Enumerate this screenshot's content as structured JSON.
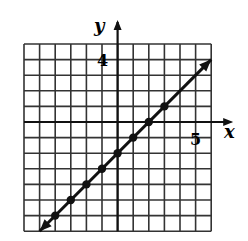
{
  "chart_data": {
    "type": "line",
    "title": "",
    "xlabel": "x",
    "ylabel": "y",
    "xlim": [
      -6,
      6
    ],
    "ylim": [
      -7,
      5
    ],
    "grid": true,
    "tick_labels": [
      {
        "axis": "y",
        "value": 4,
        "label": "4"
      },
      {
        "axis": "x",
        "value": 5,
        "label": "5"
      }
    ],
    "series": [
      {
        "name": "y = x - 2",
        "slope": 1,
        "intercept": -2,
        "line_from": [
          -5,
          -7
        ],
        "line_to": [
          6,
          4
        ],
        "arrows_both_ends": true,
        "points": [
          [
            -4,
            -6
          ],
          [
            -3,
            -5
          ],
          [
            -2,
            -4
          ],
          [
            -1,
            -3
          ],
          [
            0,
            -2
          ],
          [
            1,
            -1
          ],
          [
            2,
            0
          ],
          [
            3,
            1
          ]
        ]
      }
    ]
  },
  "labels": {
    "x_axis": "x",
    "y_axis": "y",
    "tick_y": "4",
    "tick_x": "5"
  },
  "colors": {
    "ink": "#111111",
    "grid": "#333333",
    "background": "#ffffff"
  }
}
